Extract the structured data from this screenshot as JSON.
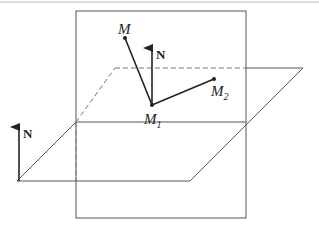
{
  "diagram": {
    "type": "geometry-3d",
    "colors": {
      "line": "#555555",
      "ink": "#222222",
      "background": "#ffffff"
    },
    "labels": {
      "M": {
        "main": "M",
        "sub": ""
      },
      "M1": {
        "main": "M",
        "sub": "1"
      },
      "M2": {
        "main": "M",
        "sub": "2"
      },
      "N_vertical": "N",
      "N_left": "N"
    },
    "points": {
      "M": [
        125,
        38
      ],
      "M1": [
        152,
        105
      ],
      "M2": [
        214,
        79
      ]
    }
  }
}
